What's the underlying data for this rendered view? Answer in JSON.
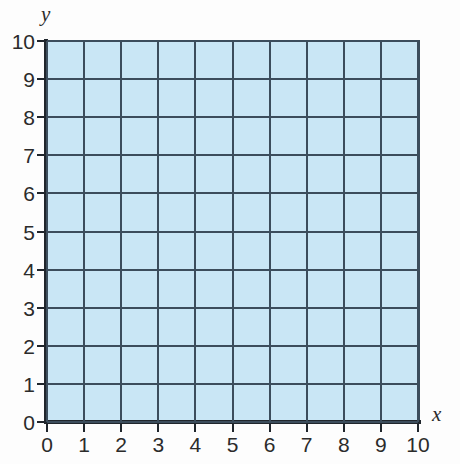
{
  "chart_data": {
    "type": "grid",
    "title": "",
    "xlabel": "x",
    "ylabel": "y",
    "xlim": [
      0,
      10
    ],
    "ylim": [
      0,
      10
    ],
    "x_ticks": [
      0,
      1,
      2,
      3,
      4,
      5,
      6,
      7,
      8,
      9,
      10
    ],
    "y_ticks": [
      0,
      1,
      2,
      3,
      4,
      5,
      6,
      7,
      8,
      9,
      10
    ],
    "x_tick_labels": [
      "0",
      "1",
      "2",
      "3",
      "4",
      "5",
      "6",
      "7",
      "8",
      "9",
      "10"
    ],
    "y_tick_labels": [
      "0",
      "1",
      "2",
      "3",
      "4",
      "5",
      "6",
      "7",
      "8",
      "9",
      "10"
    ],
    "grid": true,
    "grid_step": 1,
    "legend": null,
    "series": [],
    "values": [],
    "annotations": [],
    "colors": {
      "plot_fill": "#c9e6f5",
      "gridline": "#3c4d5c",
      "axis": "#20262c",
      "tick_label": "#2b2b2b",
      "background": "#fdfdfd"
    }
  }
}
